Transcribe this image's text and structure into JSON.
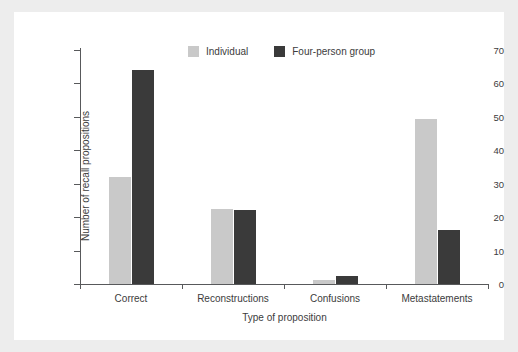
{
  "chart_data": {
    "type": "bar",
    "title": "",
    "xlabel": "Type of proposition",
    "ylabel": "Number of recall propositions",
    "categories": [
      "Correct",
      "Reconstructions",
      "Confusions",
      "Metastatements"
    ],
    "series": [
      {
        "name": "Individual",
        "color": "#c9c9c9",
        "values": [
          32,
          22.5,
          1.3,
          49.4
        ]
      },
      {
        "name": "Four-person group",
        "color": "#3a3a3a",
        "values": [
          64,
          22,
          2.5,
          16.2
        ]
      }
    ],
    "ylim": [
      0,
      70
    ],
    "yticks": [
      0,
      10,
      20,
      30,
      40,
      50,
      60,
      70
    ],
    "ytick_labels": [
      "0",
      "10",
      "20",
      "30",
      "40",
      "50",
      "60",
      "70"
    ],
    "grid": false,
    "legend_position": "top-center"
  },
  "legend": {
    "items": [
      {
        "label": "Individual",
        "swatch": "light-gray-square"
      },
      {
        "label": "Four-person group",
        "swatch": "dark-gray-square"
      }
    ]
  },
  "colors": {
    "figure_background": "#ffffff",
    "page_background": "#ededed",
    "axis": "#58595b",
    "text": "#3c3c3c",
    "series_individual": "#c9c9c9",
    "series_group": "#3a3a3a"
  }
}
